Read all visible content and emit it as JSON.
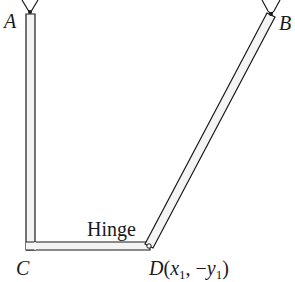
{
  "diagram": {
    "labels": {
      "a": "A",
      "b": "B",
      "c": "C",
      "d_point": "D",
      "d_open": "(",
      "d_x": "x",
      "d_x_sub": "1",
      "d_comma": ", −",
      "d_y": "y",
      "d_y_sub": "1",
      "d_close": ")",
      "hinge": "Hinge"
    },
    "colors": {
      "ink": "#1a1a1a",
      "rod_fill": "#f4f4f4"
    }
  }
}
